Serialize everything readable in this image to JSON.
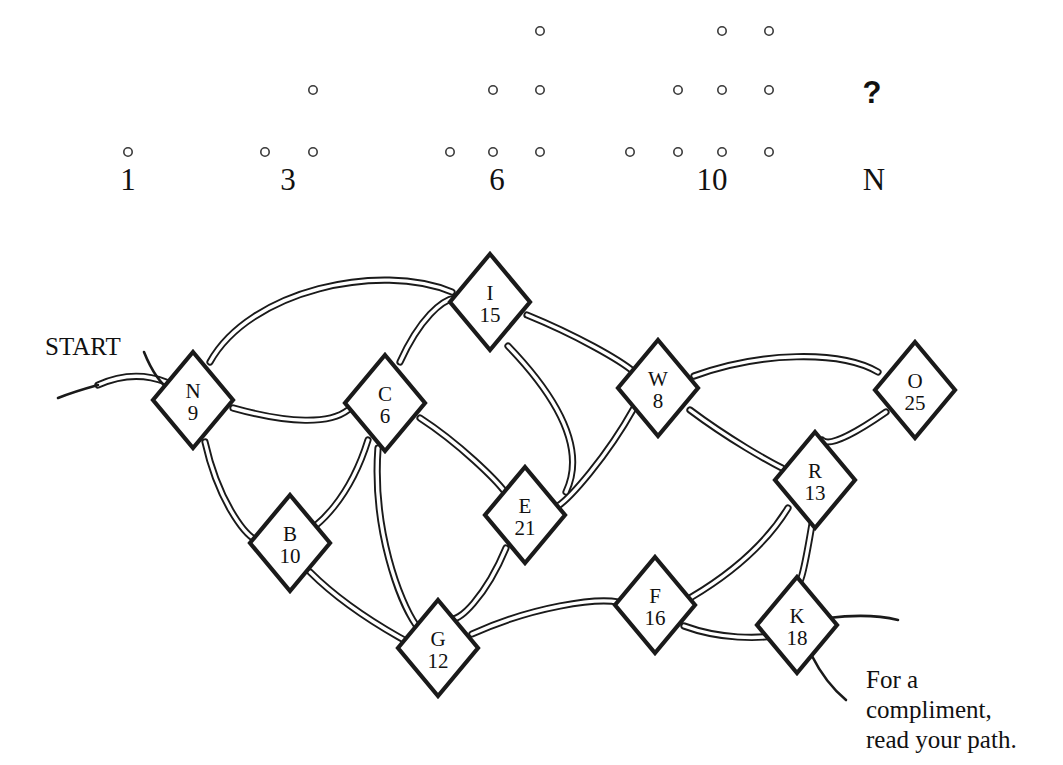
{
  "puzzle": {
    "title": "Triangular number maze puzzle",
    "top_label_row_y": 190,
    "question_mark": "?",
    "dot_groups": [
      {
        "label": "1",
        "rows": 1,
        "center_x": 128,
        "dots": [
          [
            128,
            152
          ]
        ]
      },
      {
        "label": "3",
        "rows": 2,
        "center_x": 288,
        "dots": [
          [
            265,
            152
          ],
          [
            313,
            152
          ],
          [
            313,
            90
          ]
        ]
      },
      {
        "label": "6",
        "rows": 3,
        "center_x": 497,
        "dots": [
          [
            450,
            152
          ],
          [
            493,
            152
          ],
          [
            540,
            152
          ],
          [
            493,
            90
          ],
          [
            540,
            90
          ],
          [
            540,
            31
          ]
        ]
      },
      {
        "label": "10",
        "rows": 4,
        "center_x": 712,
        "dots": [
          [
            630,
            152
          ],
          [
            678,
            152
          ],
          [
            722,
            152
          ],
          [
            769,
            152
          ],
          [
            678,
            90
          ],
          [
            722,
            90
          ],
          [
            769,
            90
          ],
          [
            722,
            31
          ],
          [
            769,
            31
          ]
        ]
      },
      {
        "label": "N",
        "rows": 0,
        "center_x": 874,
        "dots": []
      }
    ],
    "question_mark_pos": [
      872,
      103
    ]
  },
  "maze": {
    "start_label": "START",
    "start_label_pos": [
      45,
      355
    ],
    "caption": [
      "For a",
      "compliment,",
      "read your path."
    ],
    "caption_pos": [
      866,
      688
    ],
    "nodes": [
      {
        "id": "N",
        "letter": "N",
        "number": "9",
        "x": 193,
        "y": 400,
        "rx": 40,
        "ry": 48
      },
      {
        "id": "C",
        "letter": "C",
        "number": "6",
        "x": 385,
        "y": 403,
        "rx": 40,
        "ry": 48
      },
      {
        "id": "I",
        "letter": "I",
        "number": "15",
        "x": 490,
        "y": 302,
        "rx": 40,
        "ry": 48
      },
      {
        "id": "W",
        "letter": "W",
        "number": "8",
        "x": 658,
        "y": 388,
        "rx": 40,
        "ry": 48
      },
      {
        "id": "O",
        "letter": "O",
        "number": "25",
        "x": 915,
        "y": 390,
        "rx": 40,
        "ry": 48
      },
      {
        "id": "R",
        "letter": "R",
        "number": "13",
        "x": 815,
        "y": 480,
        "rx": 40,
        "ry": 48
      },
      {
        "id": "B",
        "letter": "B",
        "number": "10",
        "x": 290,
        "y": 543,
        "rx": 40,
        "ry": 48
      },
      {
        "id": "E",
        "letter": "E",
        "number": "21",
        "x": 525,
        "y": 515,
        "rx": 40,
        "ry": 48
      },
      {
        "id": "G",
        "letter": "G",
        "number": "12",
        "x": 438,
        "y": 648,
        "rx": 40,
        "ry": 48
      },
      {
        "id": "F",
        "letter": "F",
        "number": "16",
        "x": 655,
        "y": 605,
        "rx": 40,
        "ry": 48
      },
      {
        "id": "K",
        "letter": "K",
        "number": "18",
        "x": 797,
        "y": 625,
        "rx": 40,
        "ry": 48
      }
    ],
    "edges": [
      {
        "from": "N",
        "to": "I",
        "d": "M 210 362 C 250 290 380 262 452 292"
      },
      {
        "from": "N",
        "to": "C",
        "d": "M 233 408 C 290 424 330 424 348 410"
      },
      {
        "from": "N",
        "to": "B",
        "d": "M 205 442 C 218 500 244 534 256 540"
      },
      {
        "from": "N",
        "to": "start-curve",
        "d": "M 166 382 C 140 372 118 376 98 385"
      },
      {
        "from": "C",
        "to": "I",
        "d": "M 400 362 C 420 318 442 300 455 298"
      },
      {
        "from": "C",
        "to": "B",
        "d": "M 368 440 C 350 498 318 528 300 535"
      },
      {
        "from": "C",
        "to": "E",
        "d": "M 420 418 C 460 444 496 480 505 492"
      },
      {
        "from": "C",
        "to": "G",
        "d": "M 378 448 C 372 530 400 602 416 625"
      },
      {
        "from": "I",
        "to": "W",
        "d": "M 527 315 C 576 335 620 360 634 372"
      },
      {
        "from": "I",
        "to": "E",
        "d": "M 508 346 C 560 400 586 450 566 492"
      },
      {
        "from": "W",
        "to": "O",
        "d": "M 694 376 C 760 352 840 350 878 372"
      },
      {
        "from": "W",
        "to": "R",
        "d": "M 690 410 C 730 440 770 462 782 468"
      },
      {
        "from": "W",
        "to": "E",
        "d": "M 634 408 C 606 458 570 498 558 506"
      },
      {
        "from": "O",
        "to": "R",
        "d": "M 886 412 C 860 430 830 448 822 440"
      },
      {
        "from": "R",
        "to": "F",
        "d": "M 788 508 C 756 560 700 592 690 598"
      },
      {
        "from": "R",
        "to": "K",
        "d": "M 812 524 C 806 560 800 590 798 580"
      },
      {
        "from": "B",
        "to": "G",
        "d": "M 310 572 C 348 610 394 634 404 640"
      },
      {
        "from": "E",
        "to": "G",
        "d": "M 506 548 C 486 596 458 624 450 618"
      },
      {
        "from": "G",
        "to": "F",
        "d": "M 472 634 C 534 606 596 598 618 602"
      },
      {
        "from": "F",
        "to": "K",
        "d": "M 684 626 C 722 640 760 638 772 636"
      }
    ],
    "start_stub": [
      "M 144 352 C 152 372 160 384 172 392",
      "M 98 385 C 80 390 68 394 58 398"
    ],
    "end_stub": [
      "M 828 618 C 860 614 882 616 898 620",
      "M 812 656 C 822 676 834 690 846 700"
    ],
    "colors": {
      "ink": "#1a1a1a",
      "paper": "#ffffff",
      "dot_stroke": "#3a3a3a"
    }
  }
}
